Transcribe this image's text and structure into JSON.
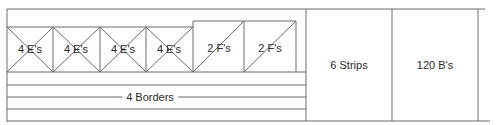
{
  "diagram": {
    "type": "cutting-layout",
    "stroke_color": "#6a6a6a",
    "text_color": "#2a2a2a",
    "e_blocks": [
      {
        "label": "4 E's"
      },
      {
        "label": "4 E's"
      },
      {
        "label": "4 E's"
      },
      {
        "label": "4 E's"
      }
    ],
    "f_blocks": [
      {
        "label": "2 F's"
      },
      {
        "label": "2 F's"
      }
    ],
    "borders_label": "4 Borders",
    "strips_label": "6 Strips",
    "b_label": "120 B's"
  }
}
